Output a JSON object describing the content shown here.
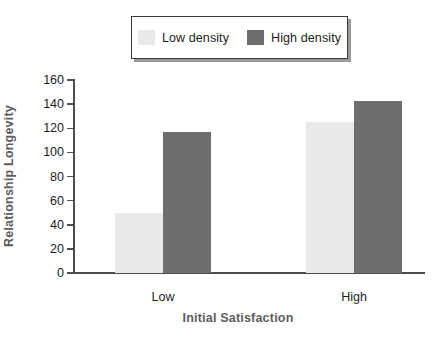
{
  "chart_data": {
    "type": "bar",
    "title": "",
    "xlabel": "Initial Satisfaction",
    "ylabel": "Relationship Longevity",
    "categories": [
      "Low",
      "High"
    ],
    "series": [
      {
        "name": "Low density",
        "color": "#e9e9e9",
        "values": [
          50,
          125
        ]
      },
      {
        "name": "High density",
        "color": "#6e6e6e",
        "values": [
          117,
          143
        ]
      }
    ],
    "ylim": [
      0,
      160
    ],
    "yticks": [
      0,
      20,
      40,
      60,
      80,
      100,
      120,
      140,
      160
    ],
    "ytick_labels": [
      "0",
      "20",
      "40",
      "60",
      "80",
      "100",
      "120",
      "140",
      "160"
    ],
    "grid": false,
    "legend_position": "top-center"
  },
  "legend": {
    "entries": [
      {
        "label": "Low density",
        "swatch": "low-density-swatch"
      },
      {
        "label": "High density",
        "swatch": "high-density-swatch"
      }
    ]
  },
  "axes": {
    "y_title": "Relationship Longevity",
    "x_title": "Initial Satisfaction",
    "category_labels": [
      "Low",
      "High"
    ]
  },
  "colors": {
    "low_density": "#e9e9e9",
    "high_density": "#6e6e6e",
    "axis": "#4d4d4d",
    "axis_title": "#5d5d5d",
    "tick_text": "#1c1c1c",
    "legend_border": "#3a3a3a",
    "legend_shadow": "#9a9a9a",
    "background": "#ffffff"
  }
}
